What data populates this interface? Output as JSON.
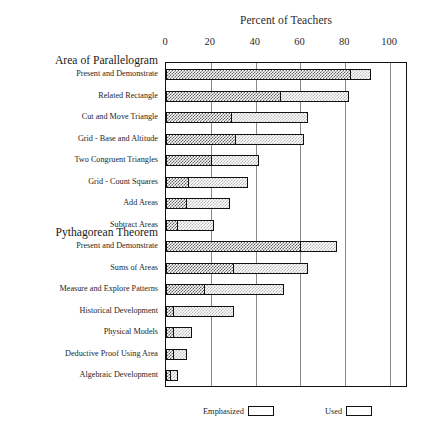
{
  "chart_data": {
    "type": "bar",
    "orientation": "horizontal",
    "stacked": true,
    "title": "Percent of Teachers",
    "xlabel": "",
    "ylabel": "",
    "xlim": [
      0,
      108
    ],
    "xticks": [
      0,
      20,
      40,
      60,
      80,
      100
    ],
    "xtick_labels": [
      "0",
      "20",
      "40",
      "60",
      "80",
      "100"
    ],
    "grid": true,
    "grid_axis": "x",
    "legend_position": "bottom",
    "legend": [
      {
        "name": "Emphasized",
        "fill": "dark-checkerboard",
        "color": "#5f5f5f"
      },
      {
        "name": "Used",
        "fill": "light-checkerboard",
        "color": "#b9b9b9"
      }
    ],
    "groups": [
      {
        "header": "Area of Parallelogram",
        "categories": [
          "Present and Demonstrate",
          "Related Rectangle",
          "Cut and Move Triangle",
          "Grid - Base and Altitude",
          "Two Congruent Triangles",
          "Grid - Count Squares",
          "Add Areas",
          "Subtract Areas"
        ]
      },
      {
        "header": "Pythagorean Theorem",
        "categories": [
          "Present and Demonstrate",
          "Sums of Areas",
          "Measure and Explore Patterns",
          "Historical Development",
          "Physical Models",
          "Deductive Proof Using Area",
          "Algebraic Development"
        ]
      }
    ],
    "categories": [
      "Present and Demonstrate",
      "Related Rectangle",
      "Cut and Move Triangle",
      "Grid - Base and Altitude",
      "Two Congruent Triangles",
      "Grid - Count Squares",
      "Add Areas",
      "Subtract Areas",
      "Present and Demonstrate",
      "Sums of Areas",
      "Measure and Explore Patterns",
      "Historical Development",
      "Physical Models",
      "Deductive Proof Using Area",
      "Algebraic Development"
    ],
    "series": [
      {
        "name": "Emphasized",
        "values": [
          82,
          51,
          29,
          31,
          20,
          10,
          9,
          5,
          60,
          30,
          17,
          3,
          3,
          3,
          2
        ]
      },
      {
        "name": "Used",
        "values": [
          9,
          30,
          34,
          30,
          21,
          26,
          19,
          16,
          16,
          33,
          35,
          27,
          8,
          6,
          3
        ]
      }
    ],
    "totals": [
      91,
      81,
      63,
      61,
      41,
      36,
      28,
      21,
      76,
      63,
      52,
      30,
      11,
      9,
      5
    ]
  }
}
